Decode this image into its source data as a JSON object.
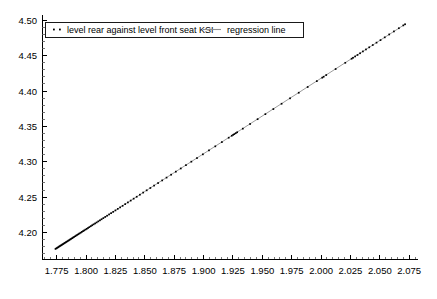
{
  "chart_data": {
    "type": "scatter",
    "title": "",
    "subtitle": "",
    "xlabel": "",
    "ylabel": "",
    "xlim": [
      1.7625,
      2.0825
    ],
    "ylim": [
      4.1625,
      4.5075
    ],
    "grid": false,
    "legend_position": "top-left",
    "x_ticks": [
      "1.775",
      "1.800",
      "1.825",
      "1.850",
      "1.875",
      "1.900",
      "1.925",
      "1.950",
      "1.975",
      "2.000",
      "2.025",
      "2.050",
      "2.075"
    ],
    "x_tick_values": [
      1.775,
      1.8,
      1.825,
      1.85,
      1.875,
      1.9,
      1.925,
      1.95,
      1.975,
      2.0,
      2.025,
      2.05,
      2.075
    ],
    "x_minor_step": 0.005,
    "y_ticks": [
      "4.50",
      "4.45",
      "4.40",
      "4.35",
      "4.30",
      "4.25",
      "4.20"
    ],
    "y_tick_values": [
      4.5,
      4.45,
      4.4,
      4.35,
      4.3,
      4.25,
      4.2
    ],
    "y_minor_step": 0.01,
    "legend": [
      {
        "label": "level rear against level front seat KSI",
        "marker": "points",
        "color": "#000000"
      },
      {
        "label": "regression line",
        "marker": "line",
        "color": "#909090"
      }
    ],
    "series": [
      {
        "name": "level rear against level front seat KSI",
        "marker": "points",
        "color": "#000000",
        "x": [
          1.774,
          1.7748,
          1.7755,
          1.7762,
          1.777,
          1.7776,
          1.7783,
          1.779,
          1.7797,
          1.7804,
          1.7812,
          1.7819,
          1.7827,
          1.7834,
          1.7842,
          1.785,
          1.7858,
          1.7866,
          1.7874,
          1.7882,
          1.789,
          1.7899,
          1.7908,
          1.7917,
          1.7926,
          1.7935,
          1.7944,
          1.7954,
          1.7964,
          1.7974,
          1.7984,
          1.7995,
          1.8006,
          1.8017,
          1.8028,
          1.804,
          1.8052,
          1.8064,
          1.8077,
          1.809,
          1.8104,
          1.8118,
          1.8132,
          1.8147,
          1.8163,
          1.8179,
          1.8196,
          1.8213,
          1.8231,
          1.825,
          1.827,
          1.829,
          1.8311,
          1.8333,
          1.8356,
          1.838,
          1.8405,
          1.8431,
          1.8458,
          1.8486,
          1.8516,
          1.8547,
          1.8579,
          1.8613,
          1.8648,
          1.8685,
          1.8724,
          1.8764,
          1.8806,
          1.885,
          1.8896,
          1.8944,
          1.8994,
          1.9046,
          1.91,
          1.9156,
          1.9214,
          1.924,
          1.9252,
          1.9262,
          1.9274,
          1.9286,
          1.9334,
          1.9396,
          1.946,
          1.9526,
          1.9594,
          1.9664,
          1.9736,
          1.981,
          1.9886,
          1.9964,
          2.001,
          2.0022,
          2.0044,
          2.0124,
          2.0206,
          2.026,
          2.0272,
          2.029,
          2.031,
          2.0332,
          2.0356,
          2.0382,
          2.041,
          2.044,
          2.0472,
          2.0506,
          2.0542,
          2.058,
          2.062,
          2.0662,
          2.07,
          2.0715
        ],
        "y": [
          4.1768,
          4.1776,
          4.1784,
          4.1791,
          4.18,
          4.1806,
          4.1814,
          4.1821,
          4.1829,
          4.1836,
          4.1845,
          4.1852,
          4.1861,
          4.1868,
          4.1877,
          4.1885,
          4.1894,
          4.1903,
          4.1911,
          4.192,
          4.1929,
          4.1938,
          4.1948,
          4.1958,
          4.1967,
          4.1977,
          4.1987,
          4.1997,
          4.2008,
          4.2019,
          4.2029,
          4.2041,
          4.2052,
          4.2064,
          4.2076,
          4.2089,
          4.2102,
          4.2115,
          4.2128,
          4.2142,
          4.2157,
          4.2172,
          4.2187,
          4.2203,
          4.222,
          4.2237,
          4.2255,
          4.2273,
          4.2292,
          4.2312,
          4.2334,
          4.2355,
          4.2377,
          4.2401,
          4.2425,
          4.2451,
          4.2478,
          4.2505,
          4.2534,
          4.2564,
          4.2596,
          4.2629,
          4.2663,
          4.2699,
          4.2736,
          4.2776,
          4.2817,
          4.286,
          4.2905,
          4.2952,
          4.3001,
          4.3052,
          4.3105,
          4.3161,
          4.3218,
          4.3278,
          4.334,
          4.3368,
          4.3381,
          4.3391,
          4.3404,
          4.3417,
          4.3468,
          4.3534,
          4.3602,
          4.3673,
          4.3745,
          4.382,
          4.3897,
          4.3976,
          4.4057,
          4.414,
          4.4189,
          4.4202,
          4.4226,
          4.4311,
          4.4399,
          4.4457,
          4.447,
          4.4489,
          4.451,
          4.4534,
          4.456,
          4.4588,
          4.4618,
          4.465,
          4.4684,
          4.472,
          4.4759,
          4.48,
          4.4843,
          4.4888,
          4.4928,
          4.4944
        ]
      },
      {
        "name": "regression line",
        "marker": "line",
        "color": "#909090",
        "x": [
          1.774,
          2.0715
        ],
        "y": [
          4.1768,
          4.4944
        ]
      }
    ]
  }
}
